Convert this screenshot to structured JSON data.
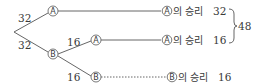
{
  "diagram": {
    "type": "tree",
    "root_branches": [
      {
        "weight": "32",
        "node": "A"
      },
      {
        "weight": "32",
        "node": "B"
      }
    ],
    "sub_branches": [
      {
        "weight": "16",
        "node": "A"
      },
      {
        "weight": "16",
        "node": "B"
      }
    ],
    "outcomes": [
      {
        "node": "A",
        "suffix": "의 승리",
        "value": "32",
        "line": "solid"
      },
      {
        "node": "A",
        "suffix": "의 승리",
        "value": "16",
        "line": "solid"
      },
      {
        "node": "B",
        "suffix": "의 승리",
        "value": "16",
        "line": "dotted"
      }
    ],
    "brace_total": "48"
  }
}
